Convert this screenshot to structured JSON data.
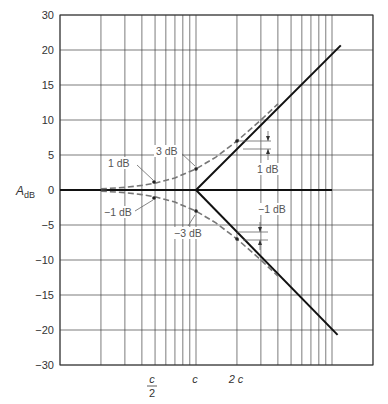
{
  "chart_data": {
    "type": "line",
    "title": "",
    "xlabel": "",
    "ylabel": "A_dB",
    "xscale": "log",
    "x_unit": "c",
    "xlim": [
      0.1,
      20
    ],
    "ylim": [
      -30,
      30
    ],
    "grid": true,
    "x_grid": [
      0.1,
      0.2,
      0.3,
      0.4,
      0.5,
      0.6,
      0.7,
      0.8,
      0.9,
      1,
      2,
      3,
      4,
      5,
      6,
      7,
      8,
      9,
      10,
      20
    ],
    "x_tick_labels": [
      {
        "x": 0.5,
        "label": "c/2"
      },
      {
        "x": 1,
        "label": "c"
      },
      {
        "x": 2,
        "label": "2 c"
      }
    ],
    "y_ticks": [
      30,
      20,
      15,
      10,
      5,
      0,
      -5,
      -10,
      -15,
      -20,
      -30
    ],
    "y_tick_labels": [
      "30",
      "20",
      "15",
      "10",
      "5",
      "0",
      "−5",
      "−10",
      "−15",
      "−20",
      "−30"
    ],
    "series": [
      {
        "name": "0 dB asymptote",
        "style": "solid",
        "x": [
          0.1,
          10
        ],
        "y": [
          0,
          0
        ]
      },
      {
        "name": "upper asymptote (+20 dB/decade)",
        "style": "solid",
        "x": [
          1,
          11.6
        ],
        "y": [
          0,
          21.3
        ]
      },
      {
        "name": "lower asymptote (−20 dB/decade)",
        "style": "solid",
        "x": [
          1,
          11.0
        ],
        "y": [
          0,
          -21.4
        ]
      },
      {
        "name": "exact upper curve",
        "style": "dashed",
        "x": [
          0.2,
          0.3,
          0.4,
          0.5,
          0.7,
          1,
          1.4,
          2,
          3,
          4
        ],
        "y": [
          0.17,
          0.37,
          0.65,
          0.97,
          1.73,
          3.01,
          4.7,
          6.99,
          10.0,
          12.3
        ]
      },
      {
        "name": "exact lower curve",
        "style": "dashed",
        "x": [
          0.2,
          0.3,
          0.4,
          0.5,
          0.7,
          1,
          1.4,
          2,
          3,
          4
        ],
        "y": [
          -0.17,
          -0.37,
          -0.65,
          -0.97,
          -1.73,
          -3.01,
          -4.7,
          -6.99,
          -10.0,
          -12.3
        ]
      }
    ],
    "annotations": [
      {
        "text": "1 dB",
        "x": 0.5,
        "y": 1
      },
      {
        "text": "3 dB",
        "x": 1,
        "y": 3
      },
      {
        "text": "−1 dB",
        "x": 0.5,
        "y": -1
      },
      {
        "text": "−3 dB",
        "x": 1,
        "y": -3
      },
      {
        "text": "1 dB",
        "x": 2,
        "y": 7,
        "note": "difference between curve and asymptote at 2c"
      },
      {
        "text": "−1 dB",
        "x": 2,
        "y": -7,
        "note": "difference between curve and asymptote at 2c"
      }
    ]
  },
  "labels": {
    "ylabel_main": "A",
    "ylabel_sub": "dB",
    "x_c_over_2_num": "c",
    "x_c_over_2_den": "2",
    "x_c": "c",
    "x_2c": "2 c",
    "ann_1db": "1 dB",
    "ann_3db": "3 dB",
    "ann_m1db": "−1 dB",
    "ann_m3db": "−3 dB",
    "ann_right_1db": "1 dB",
    "ann_right_m1db": "−1 dB"
  }
}
